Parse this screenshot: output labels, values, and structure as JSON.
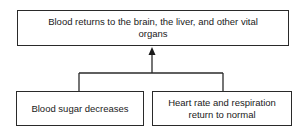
{
  "diagram": {
    "type": "flowchart",
    "top_node": {
      "label": "Blood returns to the brain, the liver, and other vital organs"
    },
    "bottom_nodes": [
      {
        "label": "Blood sugar decreases"
      },
      {
        "label": "Heart rate and respiration return to normal"
      }
    ],
    "edges": [
      {
        "from": "Blood sugar decreases",
        "to": "Blood returns to the brain, the liver, and other vital organs"
      },
      {
        "from": "Heart rate and respiration return to normal",
        "to": "Blood returns to the brain, the liver, and other vital organs"
      }
    ],
    "colors": {
      "line": "#2a2a2a",
      "background": "#ffffff",
      "text": "#1a1a1a"
    }
  }
}
